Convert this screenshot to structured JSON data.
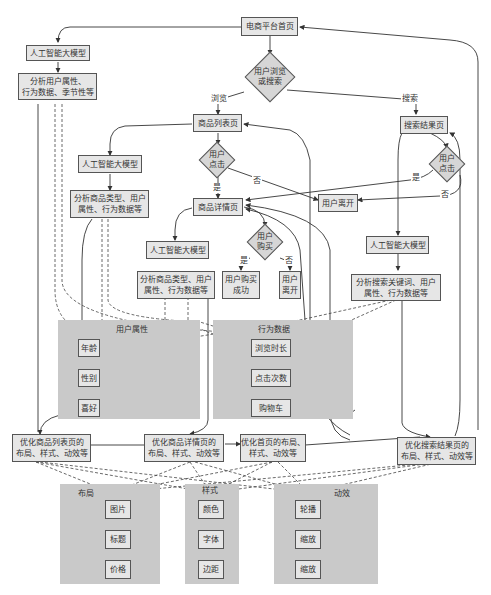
{
  "title": "电商平台首页",
  "nodes": {
    "home": "电商平台首页",
    "browse_or_search": [
      "用户浏览",
      "或搜索"
    ],
    "ai_model_left": "人工智能大模型",
    "analyze_home": [
      "分析用户属性、",
      "行为数据、季节性等"
    ],
    "product_list": "商品列表页",
    "ai_model_list": "人工智能大模型",
    "analyze_list": [
      "分析商品类型、用户",
      "属性、行为数据等"
    ],
    "list_click": [
      "用户",
      "点击"
    ],
    "product_detail": "商品详情页",
    "ai_model_detail": "人工智能大模型",
    "analyze_detail": [
      "分析商品类型、用户",
      "属性、行为数据等"
    ],
    "purchase": [
      "用户",
      "购买"
    ],
    "purchase_success": [
      "用户购买",
      "成功"
    ],
    "user_leave_small": [
      "用户",
      "离开"
    ],
    "user_leave": "用户离开",
    "search_result": "搜索结果页",
    "search_click": [
      "用户",
      "点击"
    ],
    "ai_model_search": "人工智能大模型",
    "analyze_search": [
      "分析搜索关键词、用户",
      "属性、行为数据等"
    ],
    "opt_list": [
      "优化商品列表页的",
      "布局、样式、动效等"
    ],
    "opt_detail": [
      "优化商品详情页的",
      "布局、样式、动效等"
    ],
    "opt_home": [
      "优化首页的布局、",
      "样式、动效等"
    ],
    "opt_search": [
      "优化搜索结果页的",
      "布局、样式、动效等"
    ]
  },
  "edge_labels": {
    "browse": "浏览",
    "search": "搜索",
    "list_yes": "是",
    "list_no": "否",
    "search_yes": "是",
    "search_no": "否",
    "buy_yes": "是",
    "buy_no": "否"
  },
  "groups": {
    "user_attributes": {
      "label": "用户属性",
      "items": [
        "年龄",
        "性别",
        "喜好"
      ]
    },
    "behavior_data": {
      "label": "行为数据",
      "items": [
        "浏览时长",
        "点击次数",
        "购物车"
      ]
    },
    "layout": {
      "label": "布局",
      "items": [
        "图片",
        "标题",
        "价格"
      ]
    },
    "style": {
      "label": "样式",
      "items": [
        "颜色",
        "字体",
        "边距"
      ]
    },
    "animation": {
      "label": "动效",
      "items": [
        "轮播",
        "缩放",
        "缩放"
      ]
    }
  },
  "colors": {
    "node_fill": "#e6e6e6",
    "diamond_fill": "#d6d6d6",
    "group_fill": "#c9c9c9",
    "stroke": "#555555"
  }
}
